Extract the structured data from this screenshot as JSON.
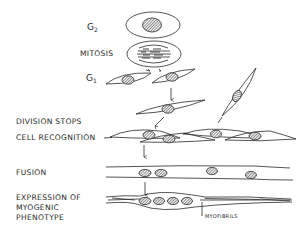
{
  "diagram": {
    "title": "",
    "stages": [
      {
        "id": "g2",
        "label_main": "G",
        "label_sub": "2"
      },
      {
        "id": "mitosis",
        "label": "MITOSIS"
      },
      {
        "id": "g1",
        "label_main": "G",
        "label_sub": "1"
      },
      {
        "id": "division_stops",
        "label": "DIVISION STOPS"
      },
      {
        "id": "cell_recognition",
        "label": "CELL RECOGNITION"
      },
      {
        "id": "fusion",
        "label": "FUSION"
      },
      {
        "id": "expression",
        "label_lines": [
          "EXPRESSION OF",
          "MYOGENIC",
          "PHENOTYPE"
        ]
      }
    ],
    "annotations": {
      "myofibrils": "MYOFIBRILS"
    },
    "colors": {
      "ink": "#2a2a2a",
      "background": "#ffffff"
    }
  }
}
